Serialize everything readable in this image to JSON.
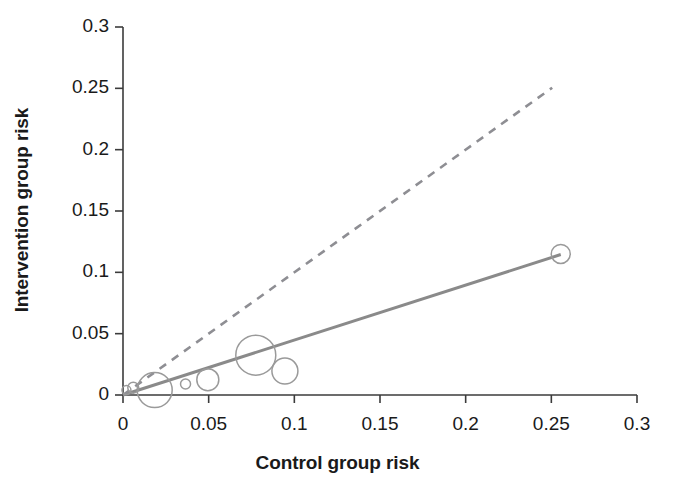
{
  "chart_data": {
    "type": "scatter",
    "title": "",
    "xlabel": "Control group risk",
    "ylabel": "Intervention group risk",
    "xlim": [
      0,
      0.3
    ],
    "ylim": [
      0,
      0.3
    ],
    "xticks": [
      "0",
      "0.05",
      "0.1",
      "0.15",
      "0.2",
      "0.25",
      "0.3"
    ],
    "xtick_values": [
      0,
      0.05,
      0.1,
      0.15,
      0.2,
      0.25,
      0.3
    ],
    "yticks": [
      "0",
      "0.05",
      "0.1",
      "0.15",
      "0.2",
      "0.25",
      "0.3"
    ],
    "ytick_values": [
      0,
      0.05,
      0.1,
      0.15,
      0.2,
      0.25,
      0.3
    ],
    "grid": false,
    "legend": "none",
    "marker_style": "open-circle",
    "bubble_size_meaning": "study weight",
    "points": [
      {
        "x": 0.002,
        "y": 0.004,
        "r": 4.5
      },
      {
        "x": 0.006,
        "y": 0.006,
        "r": 5.5
      },
      {
        "x": 0.0185,
        "y": 0.004,
        "r": 17.5
      },
      {
        "x": 0.0365,
        "y": 0.009,
        "r": 5.0
      },
      {
        "x": 0.0495,
        "y": 0.0125,
        "r": 11.0
      },
      {
        "x": 0.0775,
        "y": 0.0325,
        "r": 20.0
      },
      {
        "x": 0.0945,
        "y": 0.0195,
        "r": 13.0
      },
      {
        "x": 0.2555,
        "y": 0.115,
        "r": 9.5
      }
    ],
    "lines": [
      {
        "name": "regression-line",
        "style": "solid",
        "color": "#8a8a8a",
        "x0": 0.0,
        "y0": 0.0,
        "x1": 0.2555,
        "y1": 0.1145
      },
      {
        "name": "line-of-equality",
        "style": "dashed",
        "color": "#8e8e93",
        "x0": 0.0,
        "y0": 0.0,
        "x1": 0.2505,
        "y1": 0.2505
      }
    ],
    "colors": {
      "axis": "#3b3b3b",
      "text": "#1a1a1a",
      "marker_stroke": "#9a9a9a",
      "regression": "#8a8a8a",
      "equality": "#8e8e93",
      "background": "#ffffff"
    }
  }
}
